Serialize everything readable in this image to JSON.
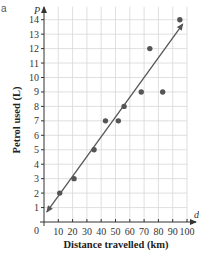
{
  "panel_label": "a",
  "chart_data": {
    "type": "scatter",
    "title": "",
    "xlabel": "Distance travelled (km)",
    "ylabel": "Petrol used (L)",
    "x_axis_letter": "d",
    "y_axis_letter": "P",
    "origin_label": "0",
    "xlim": [
      0,
      100
    ],
    "ylim": [
      0,
      14
    ],
    "x_ticks": [
      10,
      20,
      30,
      40,
      50,
      60,
      70,
      80,
      90,
      100
    ],
    "y_ticks": [
      1,
      2,
      3,
      4,
      5,
      6,
      7,
      8,
      9,
      10,
      11,
      12,
      13,
      14
    ],
    "grid": true,
    "points": [
      {
        "x": 11,
        "y": 2
      },
      {
        "x": 21,
        "y": 3
      },
      {
        "x": 35,
        "y": 5
      },
      {
        "x": 43,
        "y": 7
      },
      {
        "x": 52,
        "y": 7
      },
      {
        "x": 56,
        "y": 8
      },
      {
        "x": 68,
        "y": 9
      },
      {
        "x": 74,
        "y": 12
      },
      {
        "x": 83,
        "y": 9
      },
      {
        "x": 95,
        "y": 14
      }
    ],
    "line_of_best_fit": {
      "start": {
        "x": 2,
        "y": 0.7
      },
      "end": {
        "x": 97,
        "y": 13.7
      },
      "arrows": "both"
    },
    "colors": {
      "points": "#555555",
      "line": "#555555",
      "grid": "#d8d8d8",
      "axis": "#333333"
    }
  }
}
